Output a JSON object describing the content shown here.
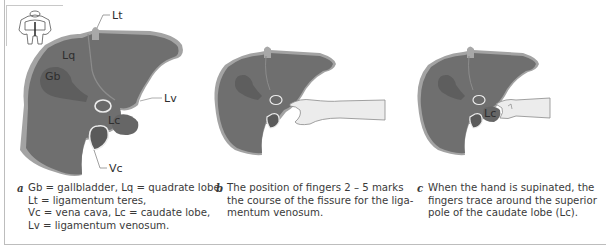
{
  "figure": {
    "panels": [
      {
        "letter": "a",
        "labels": {
          "lt": "Lt",
          "lq": "Lq",
          "gb": "Gb",
          "lv": "Lv",
          "lc": "Lc",
          "vc": "Vc"
        },
        "caption_lines": [
          "Gb = gallbladder, Lq = quadrate lobe,",
          "Lt = ligamentum teres,",
          "Vc = vena cava, Lc = caudate lobe,",
          "Lv = ligamentum venosum."
        ]
      },
      {
        "letter": "b",
        "labels": {},
        "caption_lines": [
          "The position of fingers 2 – 5 marks",
          "the course of the fissure for the liga-",
          "mentum venosum."
        ]
      },
      {
        "letter": "c",
        "labels": {
          "lc": "Lc"
        },
        "caption_lines": [
          "When the hand is supinated, the",
          "fingers trace around the superior",
          "pole of the caudate lobe (Lc)."
        ]
      }
    ],
    "icons": [
      "body-orientation-icon"
    ],
    "colors": {
      "liver": "#6f6f6f",
      "liver_rim": "#a3a3a3",
      "vessel_outline": "#e8e8e8",
      "hand": "#ececec",
      "text": "#3a3a3a",
      "border": "#bdbdbd"
    }
  }
}
